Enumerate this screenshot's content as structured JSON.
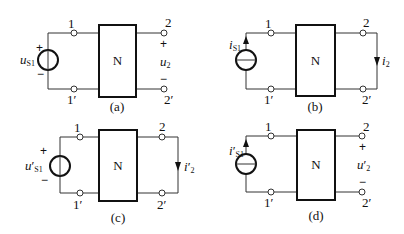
{
  "figures": {
    "a": {
      "caption": "(a)",
      "network": "N",
      "source": {
        "type": "voltage",
        "symbol": "u",
        "subscript": "S1",
        "prime": "",
        "plus": "+",
        "minus": "−"
      },
      "port1": {
        "top": "1",
        "bottom": "1′"
      },
      "port2": {
        "top": "2",
        "bottom": "2′"
      },
      "output": {
        "type": "open-circuit voltage",
        "symbol": "u",
        "subscript": "2",
        "prime": "",
        "plus": "+",
        "minus": "−"
      }
    },
    "b": {
      "caption": "(b)",
      "network": "N",
      "source": {
        "type": "current",
        "symbol": "i",
        "subscript": "S1",
        "prime": ""
      },
      "port1": {
        "top": "1",
        "bottom": "1′"
      },
      "port2": {
        "top": "2",
        "bottom": "2′"
      },
      "output": {
        "type": "short-circuit current",
        "symbol": "i",
        "subscript": "2",
        "prime": ""
      }
    },
    "c": {
      "caption": "(c)",
      "network": "N",
      "source": {
        "type": "voltage",
        "symbol": "u",
        "subscript": "S1",
        "prime": "′",
        "plus": "+",
        "minus": "−"
      },
      "port1": {
        "top": "1",
        "bottom": "1′"
      },
      "port2": {
        "top": "2",
        "bottom": "2′"
      },
      "output": {
        "type": "short-circuit current",
        "symbol": "i",
        "subscript": "2",
        "prime": "′"
      }
    },
    "d": {
      "caption": "(d)",
      "network": "N",
      "source": {
        "type": "current",
        "symbol": "i",
        "subscript": "S1",
        "prime": "′"
      },
      "port1": {
        "top": "1",
        "bottom": "1′"
      },
      "port2": {
        "top": "2",
        "bottom": "2′"
      },
      "output": {
        "type": "open-circuit voltage",
        "symbol": "u",
        "subscript": "2",
        "prime": "′",
        "plus": "+",
        "minus": "−"
      }
    }
  }
}
